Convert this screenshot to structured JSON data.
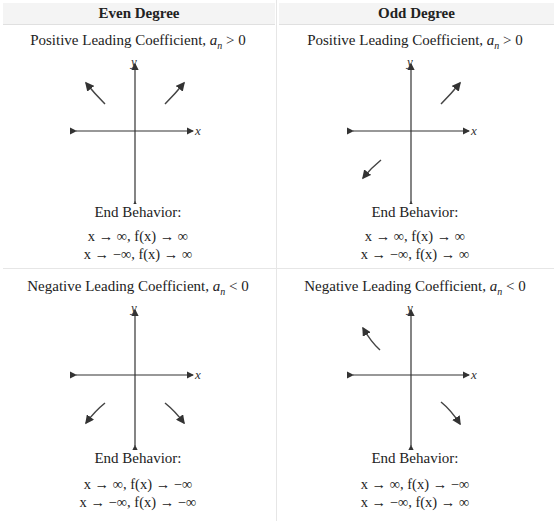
{
  "headers": [
    "Even Degree",
    "Odd Degree"
  ],
  "end_behavior_label": "End Behavior:",
  "cells": [
    {
      "column": "Even Degree",
      "condition_text": "Positive Leading Coefficient,",
      "condition_var": "a",
      "condition_sub": "n",
      "condition_rel": " > 0",
      "arrows": [
        "upper-left-up",
        "upper-right-up"
      ],
      "lines": [
        "x → ∞, f(x) → ∞",
        "x → −∞, f(x) → ∞"
      ]
    },
    {
      "column": "Odd Degree",
      "condition_text": "Positive Leading Coefficient,",
      "condition_var": "a",
      "condition_sub": "n",
      "condition_rel": " > 0",
      "arrows": [
        "lower-left-down",
        "upper-right-up"
      ],
      "lines": [
        "x → ∞, f(x) → ∞",
        "x → −∞, f(x) → ∞"
      ]
    },
    {
      "column": "Even Degree",
      "condition_text": "Negative Leading Coefficient,",
      "condition_var": "a",
      "condition_sub": "n",
      "condition_rel": " < 0",
      "arrows": [
        "lower-left-down",
        "lower-right-down"
      ],
      "lines": [
        "x → ∞, f(x) → −∞",
        "x → −∞, f(x) → −∞"
      ]
    },
    {
      "column": "Odd Degree",
      "condition_text": "Negative Leading Coefficient,",
      "condition_var": "a",
      "condition_sub": "n",
      "condition_rel": " < 0",
      "arrows": [
        "upper-left-up",
        "lower-right-down"
      ],
      "lines": [
        "x → ∞, f(x) → −∞",
        "x → −∞, f(x) → ∞"
      ]
    }
  ],
  "axis_labels": {
    "x": "x",
    "y": "y"
  }
}
